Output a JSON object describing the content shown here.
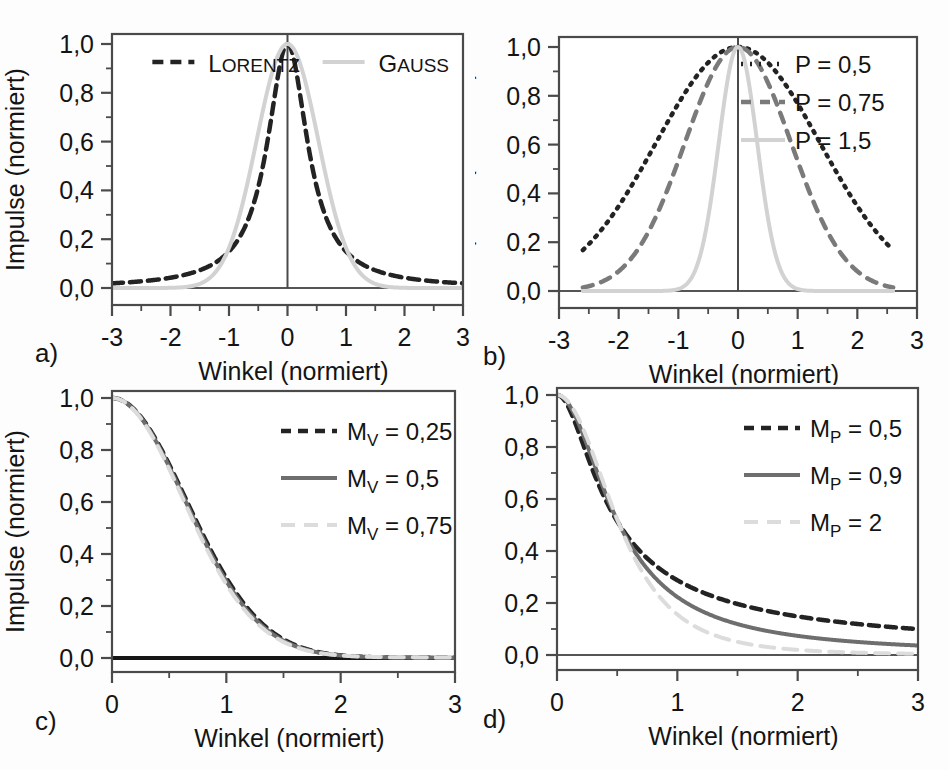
{
  "figure": {
    "width": 949,
    "height": 770,
    "background": "#fdfdfd",
    "panel_labels": [
      "a)",
      "b)",
      "c)",
      "d)"
    ]
  },
  "colors": {
    "black": "#1a1a1a",
    "dark": "#232323",
    "gray": "#6e6e6e",
    "lightgray": "#d2d2d2",
    "axis": "#3b3b3b",
    "frame": "#4a4a4a"
  },
  "axis_titles": {
    "x": "Winkel (normiert)",
    "y": "Impulse (normiert)"
  },
  "chart_data": [
    {
      "id": "a",
      "panel_label": "a)",
      "type": "line",
      "title": "",
      "xlabel": "Winkel (normiert)",
      "ylabel": "Impulse (normiert)",
      "xlim": [
        -3,
        3
      ],
      "ylim": [
        -0.04,
        1.06
      ],
      "xticks": [
        -3,
        -2,
        -1,
        0,
        1,
        2,
        3
      ],
      "xticklabels": [
        "-3",
        "-2",
        "-1",
        "0",
        "1",
        "2",
        "3"
      ],
      "yticks": [
        0.0,
        0.2,
        0.4,
        0.6,
        0.8,
        1.0
      ],
      "yticklabels": [
        "0,0",
        "0,2",
        "0,4",
        "0,6",
        "0,8",
        "1,0"
      ],
      "minor_xticks": [
        -2.5,
        -1.5,
        -0.5,
        0.5,
        1.5,
        2.5
      ],
      "minor_yticks": [
        0.1,
        0.3,
        0.5,
        0.7,
        0.9
      ],
      "grid": false,
      "zero_vline": true,
      "zero_hline": true,
      "legend_position": "top-inside",
      "series": [
        {
          "name": "LORENTZ",
          "label_smallcaps": true,
          "style": "dashed",
          "color": "#232323",
          "width": 4.5,
          "dash": "11,7",
          "fn": "lorentz",
          "param": 0.42,
          "xmin": -3,
          "xmax": 3,
          "legend_x": 0.115
        },
        {
          "name": "GAUSS",
          "label_smallcaps": true,
          "style": "solid",
          "color": "#d2d2d2",
          "width": 4.0,
          "dash": "",
          "fn": "gauss",
          "param": 0.62,
          "xmin": -3,
          "xmax": 3,
          "legend_x": 0.6
        }
      ]
    },
    {
      "id": "b",
      "panel_label": "b)",
      "type": "line",
      "title": "",
      "xlabel": "Winkel (normiert)",
      "ylabel": "Impulse (normiert)",
      "xlim": [
        -3,
        3
      ],
      "ylim": [
        -0.04,
        1.06
      ],
      "xticks": [
        -3,
        -2,
        -1,
        0,
        1,
        2,
        3
      ],
      "xticklabels": [
        "-3",
        "-2",
        "-1",
        "0",
        "1",
        "2",
        "3"
      ],
      "yticks": [
        0.0,
        0.2,
        0.4,
        0.6,
        0.8,
        1.0
      ],
      "yticklabels": [
        "0,0",
        "0,2",
        "0,4",
        "0,6",
        "0,8",
        "1,0"
      ],
      "minor_xticks": [
        -2.5,
        -1.5,
        -0.5,
        0.5,
        1.5,
        2.5
      ],
      "minor_yticks": [
        0.1,
        0.3,
        0.5,
        0.7,
        0.9
      ],
      "grid": false,
      "zero_vline": true,
      "zero_hline": true,
      "legend_position": "top-right",
      "series": [
        {
          "name": "P = 0,5",
          "style": "dotted",
          "color": "#232323",
          "width": 4.5,
          "dash": "2,7",
          "fn": "gauss",
          "param": 1.62,
          "xmin": -2.6,
          "xmax": 2.6
        },
        {
          "name": "P = 0,75",
          "style": "dashed",
          "color": "#7a7a7a",
          "width": 4.5,
          "dash": "10,9",
          "fn": "gauss",
          "param": 1.05,
          "xmin": -2.6,
          "xmax": 2.6
        },
        {
          "name": "P = 1,5",
          "style": "solid",
          "color": "#d2d2d2",
          "width": 4.0,
          "dash": "",
          "fn": "gauss",
          "param": 0.38,
          "xmin": -2.6,
          "xmax": 2.6
        }
      ]
    },
    {
      "id": "c",
      "panel_label": "c)",
      "type": "line",
      "title": "",
      "xlabel": "Winkel (normiert)",
      "ylabel": "Impulse (normiert)",
      "xlim": [
        0,
        3
      ],
      "ylim": [
        -0.05,
        1.05
      ],
      "xticks": [
        0,
        1,
        2,
        3
      ],
      "xticklabels": [
        "0",
        "1",
        "2",
        "3"
      ],
      "yticks": [
        0.0,
        0.2,
        0.4,
        0.6,
        0.8,
        1.0
      ],
      "yticklabels": [
        "0,0",
        "0,2",
        "0,4",
        "0,6",
        "0,8",
        "1,0"
      ],
      "minor_xticks": [
        0.5,
        1.5,
        2.5
      ],
      "minor_yticks": [
        0.1,
        0.3,
        0.5,
        0.7,
        0.9
      ],
      "grid": false,
      "zero_vline": false,
      "zero_hline": true,
      "zero_hline_bold": true,
      "legend_position": "top-right",
      "series": [
        {
          "name": "M_V = 0,25",
          "label_base": "M",
          "label_sub": "V",
          "label_rest": " = 0,25",
          "style": "dashed",
          "color": "#232323",
          "width": 4.5,
          "dash": "10,7",
          "fn": "voigt",
          "param": 0.25,
          "xmin": 0,
          "xmax": 3
        },
        {
          "name": "M_V = 0,5",
          "label_base": "M",
          "label_sub": "V",
          "label_rest": " = 0,5",
          "style": "solid",
          "color": "#6e6e6e",
          "width": 4.0,
          "dash": "",
          "fn": "voigt",
          "param": 0.5,
          "xmin": 0,
          "xmax": 3
        },
        {
          "name": "M_V = 0,75",
          "label_base": "M",
          "label_sub": "V",
          "label_rest": " = 0,75",
          "style": "dashed",
          "color": "#dcdcdc",
          "width": 4.0,
          "dash": "14,9",
          "fn": "voigt",
          "param": 0.75,
          "xmin": 0,
          "xmax": 3
        }
      ]
    },
    {
      "id": "d",
      "panel_label": "d)",
      "type": "line",
      "title": "",
      "xlabel": "Winkel (normiert)",
      "ylabel": "Impulse (normiert)",
      "xlim": [
        0,
        3
      ],
      "ylim": [
        -0.05,
        1.05
      ],
      "xticks": [
        0,
        1,
        2,
        3
      ],
      "xticklabels": [
        "0",
        "1",
        "2",
        "3"
      ],
      "yticks": [
        0.0,
        0.2,
        0.4,
        0.6,
        0.8,
        1.0
      ],
      "yticklabels": [
        "0,0",
        "0,2",
        "0,4",
        "0,6",
        "0,8",
        "1,0"
      ],
      "minor_xticks": [
        0.5,
        1.5,
        2.5
      ],
      "minor_yticks": [
        0.1,
        0.3,
        0.5,
        0.7,
        0.9
      ],
      "grid": false,
      "zero_vline": false,
      "zero_hline": true,
      "legend_position": "top-right",
      "series": [
        {
          "name": "M_P = 0,5",
          "label_base": "M",
          "label_sub": "P",
          "label_rest": " = 0,5",
          "style": "dashed",
          "color": "#232323",
          "width": 4.5,
          "dash": "10,7",
          "fn": "pearson",
          "param": 0.5,
          "xmin": 0,
          "xmax": 3
        },
        {
          "name": "M_P = 0,9",
          "label_base": "M",
          "label_sub": "P",
          "label_rest": " = 0,9",
          "style": "solid",
          "color": "#6e6e6e",
          "width": 4.0,
          "dash": "",
          "fn": "pearson",
          "param": 0.9,
          "xmin": 0,
          "xmax": 3
        },
        {
          "name": "M_P = 2",
          "label_base": "M",
          "label_sub": "P",
          "label_rest": " = 2",
          "style": "dashed",
          "color": "#dcdcdc",
          "width": 4.0,
          "dash": "14,9",
          "fn": "pearson",
          "param": 2.0,
          "xmin": 0,
          "xmax": 3
        }
      ]
    }
  ]
}
